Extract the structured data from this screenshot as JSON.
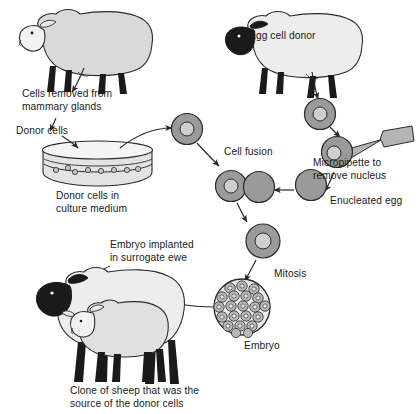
{
  "diagram": {
    "background_color": "#ffffff",
    "text_color": "#1a1a1a",
    "body_fill": "#d9d9d9",
    "head_fill": "#1a1a1a",
    "leg_fill": "#1a1a1a",
    "cell_fill": "#9a9a9a",
    "nucleus_fill": "#cfcfcf",
    "pipette_fill": "#b5b5b5",
    "dish_fill": "#e3e3e3",
    "outline_color": "#2b2b2b"
  },
  "labels": {
    "cells_removed": "Cells removed from\nmammary glands",
    "donor_cells": "Donor cells",
    "donor_cells_culture": "Donor cells in\nculture medium",
    "egg_cell_donor": "Egg cell donor",
    "cell_fusion": "Cell fusion",
    "micropipette": "Micropipette to\nremove nucleus",
    "enucleated_egg": "Enucleated egg",
    "mitosis": "Mitosis",
    "embryo": "Embryo",
    "embryo_implanted": "Embryo implanted\nin surrogate ewe",
    "clone_of_sheep": "Clone of sheep that was the\nsource of the donor cells"
  },
  "stages": [
    {
      "id": "donor-sheep",
      "name": "Mammary cell donor sheep",
      "label": "Cells removed from\nmammary glands"
    },
    {
      "id": "donor-cells",
      "name": "Donor cells",
      "label": "Donor cells"
    },
    {
      "id": "culture-dish",
      "name": "Culture dish",
      "label": "Donor cells in\nculture medium",
      "cell_count": 8
    },
    {
      "id": "egg-donor-sheep",
      "name": "Egg cell donor sheep",
      "label": "Egg cell donor"
    },
    {
      "id": "egg-cell",
      "name": "Egg cell with nucleus",
      "label": ""
    },
    {
      "id": "micropipette",
      "name": "Micropipette removing nucleus",
      "label": "Micropipette to\nremove nucleus"
    },
    {
      "id": "enucleated-egg",
      "name": "Enucleated egg",
      "label": "Enucleated egg"
    },
    {
      "id": "cell-fusion",
      "name": "Cell fusion of donor cell and enucleated egg",
      "label": "Cell fusion"
    },
    {
      "id": "fused-cell",
      "name": "Fused cell",
      "label": ""
    },
    {
      "id": "mitosis",
      "name": "Mitosis",
      "label": "Mitosis"
    },
    {
      "id": "embryo",
      "name": "Embryo morula",
      "label": "Embryo",
      "cell_count": 21
    },
    {
      "id": "surrogate-ewe",
      "name": "Surrogate ewe with lamb",
      "label": "Embryo implanted\nin surrogate ewe"
    },
    {
      "id": "clone-lamb",
      "name": "Cloned lamb",
      "label": "Clone of sheep that was the\nsource of the donor cells"
    }
  ]
}
